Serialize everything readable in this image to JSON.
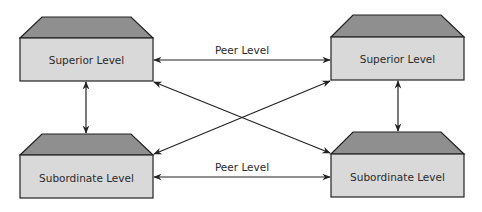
{
  "diagram": {
    "boxes": [
      {
        "id": "top-left",
        "label": "Superior Level"
      },
      {
        "id": "top-right",
        "label": "Superior Level"
      },
      {
        "id": "bottom-left",
        "label": "Subordinate Level"
      },
      {
        "id": "bottom-right",
        "label": "Subordinate Level"
      }
    ],
    "connections": [
      {
        "from": "top-left",
        "to": "top-right",
        "label": "Peer Level",
        "type": "bidirectional"
      },
      {
        "from": "bottom-left",
        "to": "bottom-right",
        "label": "Peer Level",
        "type": "bidirectional"
      },
      {
        "from": "top-left",
        "to": "bottom-left",
        "label": "",
        "type": "bidirectional"
      },
      {
        "from": "top-right",
        "to": "bottom-right",
        "label": "",
        "type": "bidirectional"
      },
      {
        "from": "top-left",
        "to": "bottom-right",
        "label": "",
        "type": "bidirectional"
      },
      {
        "from": "top-right",
        "to": "bottom-left",
        "label": "",
        "type": "bidirectional"
      }
    ],
    "colors": {
      "box_front": "#d9d9d9",
      "box_top": "#8f8f8f",
      "stroke": "#222222"
    }
  }
}
